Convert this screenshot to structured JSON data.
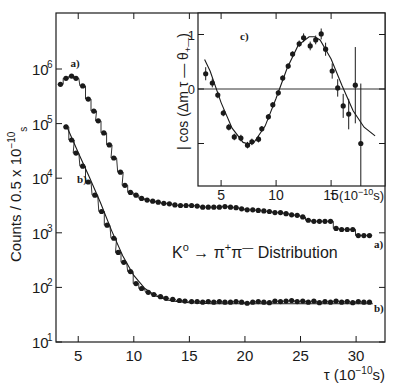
{
  "chart_data": [
    {
      "id": "main",
      "type": "scatter",
      "title": "K⁰ → π⁺π⁻ Distribution",
      "annotation": "K⁰ → π⁺π⁻ Distribution",
      "xlabel": "τ (10⁻¹⁰s)",
      "ylabel": "Counts / 0.5 x 10⁻¹⁰ s",
      "xlim": [
        3.0,
        32.6
      ],
      "ylim_log10": [
        1,
        6.98
      ],
      "yscale": "log",
      "x_ticks": [
        5,
        10,
        15,
        20,
        25,
        30
      ],
      "y_ticks": [
        {
          "exp": 6,
          "label": "10",
          "sup": "6"
        },
        {
          "exp": 5,
          "label": "10",
          "sup": "5"
        },
        {
          "exp": 4,
          "label": "10",
          "sup": "4"
        },
        {
          "exp": 3,
          "label": "10",
          "sup": "3"
        },
        {
          "exp": 2,
          "label": "10",
          "sup": "2"
        },
        {
          "exp": 1,
          "label": "10",
          "sup": "1"
        }
      ],
      "grid": false,
      "series": [
        {
          "name": "a)",
          "label_pos_start": [
            4.3,
            6.03
          ],
          "label_pos_end": [
            31.6,
            2.72
          ],
          "x": [
            3.4,
            3.9,
            4.4,
            4.8,
            5.4,
            5.9,
            6.4,
            6.8,
            7.3,
            7.8,
            8.2,
            8.8,
            9.2,
            9.7,
            10.2,
            10.7,
            11.2,
            11.7,
            12.2,
            12.7,
            13.2,
            13.7,
            14.2,
            14.7,
            15.2,
            15.7,
            16.2,
            16.7,
            17.2,
            17.7,
            18.2,
            18.7,
            19.2,
            19.7,
            20.2,
            20.7,
            21.2,
            21.7,
            22.2,
            22.7,
            23.2,
            23.7,
            24.2,
            24.7,
            25.2,
            25.7,
            26.2,
            26.7,
            27.2,
            27.7,
            28.2,
            28.7,
            29.2,
            29.7,
            30.2,
            30.7,
            31.2
          ],
          "log10_counts": [
            5.72,
            5.83,
            5.87,
            5.83,
            5.69,
            5.45,
            5.23,
            5.05,
            4.83,
            4.61,
            4.37,
            4.11,
            3.87,
            3.74,
            3.69,
            3.63,
            3.6,
            3.58,
            3.56,
            3.54,
            3.53,
            3.51,
            3.5,
            3.5,
            3.5,
            3.49,
            3.47,
            3.47,
            3.47,
            3.47,
            3.48,
            3.47,
            3.46,
            3.44,
            3.42,
            3.42,
            3.41,
            3.4,
            3.39,
            3.37,
            3.37,
            3.35,
            3.33,
            3.32,
            3.29,
            3.23,
            3.21,
            3.21,
            3.21,
            3.21,
            3.08,
            3.06,
            3.06,
            3.06,
            2.95,
            2.95,
            2.95
          ],
          "fit": "histogram-step"
        },
        {
          "name": "b)",
          "label_pos_start": [
            4.9,
            3.92
          ],
          "label_pos_end": [
            31.6,
            1.55
          ],
          "x": [
            3.9,
            4.4,
            4.8,
            5.4,
            5.9,
            6.5,
            7.1,
            7.6,
            8.2,
            8.6,
            9.1,
            9.7,
            10.2,
            10.7,
            11.3,
            11.8,
            12.4,
            12.9,
            13.5,
            14.1,
            14.6,
            15.2,
            15.7,
            16.2,
            16.7,
            17.2,
            17.7,
            18.2,
            18.7,
            19.2,
            19.7,
            20.2,
            20.7,
            21.2,
            21.7,
            22.2,
            22.7,
            23.2,
            23.7,
            24.2,
            24.7,
            25.2,
            25.7,
            26.2,
            26.7,
            27.2,
            27.7,
            28.2,
            28.7,
            29.2,
            29.7,
            30.2,
            30.7,
            31.2
          ],
          "log10_counts": [
            4.94,
            4.7,
            4.46,
            4.22,
            3.93,
            3.69,
            3.39,
            3.14,
            2.9,
            2.64,
            2.46,
            2.29,
            2.07,
            1.98,
            1.91,
            1.87,
            1.83,
            1.8,
            1.78,
            1.76,
            1.75,
            1.74,
            1.74,
            1.73,
            1.74,
            1.73,
            1.74,
            1.73,
            1.73,
            1.74,
            1.73,
            1.71,
            1.73,
            1.74,
            1.73,
            1.72,
            1.75,
            1.74,
            1.75,
            1.76,
            1.74,
            1.75,
            1.73,
            1.75,
            1.72,
            1.74,
            1.73,
            1.75,
            1.73,
            1.74,
            1.72,
            1.74,
            1.73,
            1.73
          ],
          "fit_curve_x": [
            3.9,
            5,
            6,
            7,
            8,
            9,
            10,
            11,
            12,
            13,
            14,
            15,
            16,
            17,
            18,
            20,
            25,
            31.5
          ],
          "fit_curve_log10": [
            4.98,
            4.47,
            4.02,
            3.55,
            3.04,
            2.58,
            2.22,
            1.98,
            1.84,
            1.77,
            1.74,
            1.72,
            1.71,
            1.7,
            1.7,
            1.7,
            1.7,
            1.7
          ]
        }
      ]
    },
    {
      "id": "inset",
      "type": "scatter",
      "panel_label": "c)",
      "xlabel": "τ (10⁻¹⁰s)",
      "ylabel": "| cos (Δm τ − θ₊₋)",
      "xlim": [
        2.9,
        19.9
      ],
      "ylim": [
        -1.78,
        1.42
      ],
      "x_ticks": [
        5,
        10,
        15
      ],
      "y_ticks": [
        1,
        0,
        -1
      ],
      "zero_line": true,
      "series": [
        {
          "name": "c)",
          "x": [
            3.6,
            4.2,
            4.7,
            5.2,
            5.7,
            6.2,
            6.8,
            7.4,
            7.8,
            8.4,
            8.7,
            9.3,
            9.7,
            10.2,
            10.6,
            11.1,
            11.5,
            12.1,
            12.5,
            13.1,
            13.6,
            14.1,
            14.5,
            15.1,
            15.6,
            16.1,
            16.6,
            17.2,
            17.7
          ],
          "y": [
            0.28,
            0.11,
            -0.11,
            -0.44,
            -0.7,
            -0.88,
            -0.9,
            -1.03,
            -0.97,
            -0.92,
            -0.73,
            -0.51,
            -0.29,
            -0.07,
            0.2,
            0.42,
            0.64,
            0.83,
            0.94,
            0.79,
            0.9,
            1.01,
            0.73,
            0.33,
            0.02,
            -0.31,
            -0.46,
            0.07,
            -1.0
          ],
          "yerr": [
            0.12,
            0.08,
            0.06,
            0.06,
            0.06,
            0.06,
            0.06,
            0.06,
            0.06,
            0.06,
            0.05,
            0.05,
            0.05,
            0.05,
            0.05,
            0.05,
            0.05,
            0.06,
            0.08,
            0.08,
            0.08,
            0.1,
            0.12,
            0.14,
            0.16,
            0.22,
            0.28,
            0.7,
            1.1
          ],
          "fit_curve_x": [
            3.5,
            4,
            5,
            6,
            7,
            7.5,
            8,
            9,
            10,
            11,
            12,
            13,
            13.5,
            14,
            15,
            16,
            17,
            18,
            19
          ],
          "fit_curve_y": [
            0.54,
            0.33,
            -0.25,
            -0.72,
            -0.98,
            -1.01,
            -0.98,
            -0.68,
            -0.17,
            0.38,
            0.8,
            0.96,
            0.96,
            0.9,
            0.55,
            0.06,
            -0.4,
            -0.7,
            -0.86
          ]
        }
      ]
    }
  ]
}
